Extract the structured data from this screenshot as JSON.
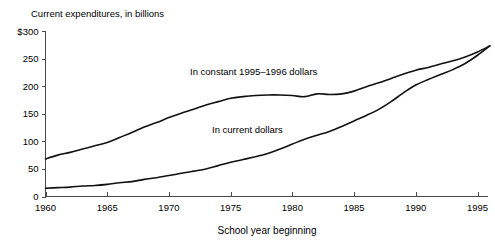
{
  "chart_data": {
    "type": "line",
    "title": "Current expenditures, in billions",
    "xlabel": "School year beginning",
    "ylabel": "",
    "xlim": [
      1960,
      1996
    ],
    "ylim": [
      0,
      300
    ],
    "grid": false,
    "legend_position": "inline-labels",
    "x_ticks": [
      1960,
      1965,
      1970,
      1975,
      1980,
      1985,
      1990,
      1995
    ],
    "x_tick_labels": [
      "1960",
      "1965",
      "1970",
      "1975",
      "1980",
      "1985",
      "1990",
      "1995"
    ],
    "y_ticks": [
      0,
      50,
      100,
      150,
      200,
      250,
      300
    ],
    "y_tick_labels": [
      "0",
      "50",
      "100",
      "150",
      "200",
      "250",
      "$300"
    ],
    "x": [
      1960,
      1961,
      1962,
      1963,
      1964,
      1965,
      1966,
      1967,
      1968,
      1969,
      1970,
      1971,
      1972,
      1973,
      1974,
      1975,
      1976,
      1977,
      1978,
      1979,
      1980,
      1981,
      1982,
      1983,
      1984,
      1985,
      1986,
      1987,
      1988,
      1989,
      1990,
      1991,
      1992,
      1993,
      1994,
      1995,
      1996
    ],
    "series": [
      {
        "name": "In constant 1995-1996 dollars",
        "label": "In constant 1995–1996 dollars",
        "color": "#111111",
        "values": [
          68,
          75,
          80,
          86,
          92,
          98,
          107,
          116,
          126,
          134,
          143,
          151,
          158,
          166,
          172,
          178,
          181,
          183,
          184,
          184,
          183,
          181,
          186,
          185,
          186,
          191,
          199,
          206,
          214,
          222,
          229,
          234,
          240,
          246,
          253,
          262,
          273
        ]
      },
      {
        "name": "In current dollars",
        "label": "In current dollars",
        "color": "#111111",
        "values": [
          15,
          16,
          17,
          19,
          20,
          22,
          25,
          27,
          31,
          34,
          38,
          42,
          46,
          50,
          56,
          62,
          67,
          72,
          78,
          86,
          95,
          104,
          111,
          118,
          127,
          137,
          147,
          158,
          172,
          188,
          202,
          212,
          221,
          230,
          241,
          256,
          273
        ]
      }
    ],
    "annotations": [
      {
        "name": "constant-dollars-label",
        "text": "In constant 1995–1996 dollars",
        "x_px": 190,
        "y_px": 75
      },
      {
        "name": "current-dollars-label",
        "text": "In current dollars",
        "x_px": 212,
        "y_px": 133
      }
    ]
  }
}
